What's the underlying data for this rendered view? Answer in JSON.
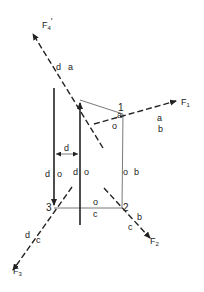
{
  "diagram": {
    "forces": {
      "F1": {
        "label": "F",
        "sub": "1"
      },
      "F2": {
        "label": "F",
        "sub": "2"
      },
      "F3": {
        "label": "F",
        "sub": "3"
      },
      "F4p": {
        "label": "F",
        "sub": "4",
        "prime": "′"
      }
    },
    "nodes": {
      "n1": "1",
      "n2": "2",
      "n3": "3"
    },
    "labels": {
      "f4_left": "d",
      "f4_right": "a",
      "top_a": "a",
      "top_o": "o",
      "f1_a": "a",
      "f1_b": "b",
      "right_o": "o",
      "right_b": "b",
      "f2_b": "b",
      "f2_c": "c",
      "bottom_o": "o",
      "bottom_c": "c",
      "f3_d": "d",
      "f3_c": "c",
      "left_d": "d",
      "left_o": "o",
      "mid_d": "d",
      "mid_o": "o",
      "dim_d": "d"
    },
    "colors": {
      "line": "#222222",
      "thin": "#555555"
    }
  }
}
